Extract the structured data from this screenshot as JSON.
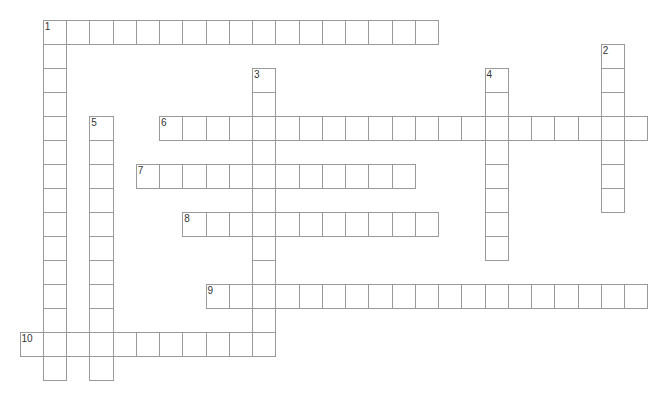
{
  "crossword": {
    "grid": {
      "origin_x": 19.5,
      "origin_y": 20,
      "cell_width": 23.25,
      "cell_height": 24,
      "border_color": "#9a9a9a",
      "number_color": "#333333"
    },
    "words": [
      {
        "number": "1",
        "direction": "across",
        "row": 0,
        "col": 1,
        "length": 17
      },
      {
        "number": "1",
        "direction": "down",
        "row": 0,
        "col": 1,
        "length": 15
      },
      {
        "number": "2",
        "direction": "down",
        "row": 1,
        "col": 25,
        "length": 7
      },
      {
        "number": "3",
        "direction": "down",
        "row": 2,
        "col": 10,
        "length": 12
      },
      {
        "number": "4",
        "direction": "down",
        "row": 2,
        "col": 20,
        "length": 8
      },
      {
        "number": "5",
        "direction": "down",
        "row": 4,
        "col": 3,
        "length": 11
      },
      {
        "number": "6",
        "direction": "across",
        "row": 4,
        "col": 6,
        "length": 21
      },
      {
        "number": "7",
        "direction": "across",
        "row": 6,
        "col": 5,
        "length": 12
      },
      {
        "number": "8",
        "direction": "across",
        "row": 8,
        "col": 7,
        "length": 11
      },
      {
        "number": "9",
        "direction": "across",
        "row": 11,
        "col": 8,
        "length": 19
      },
      {
        "number": "10",
        "direction": "across",
        "row": 13,
        "col": 0,
        "length": 11
      }
    ]
  }
}
